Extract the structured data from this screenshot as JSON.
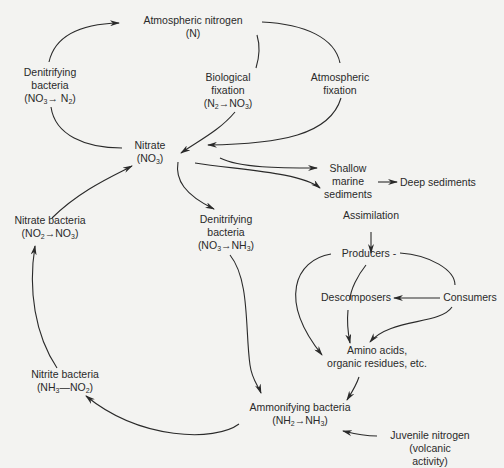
{
  "nodes": {
    "atmospheric_nitrogen": {
      "line1": "Atmospheric nitrogen",
      "line2": "(N)"
    },
    "denitrifying_top": {
      "line1": "Denitrifying",
      "line2": "bacteria",
      "line3": "(NO3 → N2)"
    },
    "biological_fixation": {
      "line1": "Biological",
      "line2": "fixation",
      "line3": "(N2 → NO3)"
    },
    "atmospheric_fixation": {
      "line1": "Atmospheric",
      "line2": "fixation"
    },
    "nitrate": {
      "line1": "Nitrate",
      "line2": "(NO3)"
    },
    "shallow_marine": {
      "line1": "Shallow",
      "line2": "marine",
      "line3": "sediments"
    },
    "deep_sediments": {
      "line1": "Deep sediments"
    },
    "assimilation": {
      "line1": "Assimilation"
    },
    "nitrate_bacteria": {
      "line1": "Nitrate bacteria",
      "line2": "(NO2 → NO3)"
    },
    "denitrifying_mid": {
      "line1": "Denitrifying",
      "line2": "bacteria",
      "line3": "(NO3 → NH3)"
    },
    "producers": {
      "line1": "Producers -"
    },
    "decomposers": {
      "line1": "Descomposers"
    },
    "consumers": {
      "line1": "Consumers"
    },
    "amino_acids": {
      "line1": "Amino acids,",
      "line2": "organic residues, etc."
    },
    "nitrite_bacteria": {
      "line1": "Nitrite bacteria",
      "line2": "(NH3 — NO2)"
    },
    "ammonifying": {
      "line1": "Ammonifying bacteria",
      "line2": "(NH2 → NH3)"
    },
    "juvenile_nitrogen": {
      "line1": "Juvenile nitrogen",
      "line2": "(volcanic",
      "line3": "activity)"
    }
  },
  "colors": {
    "background": "#f3f3f1",
    "ink": "#2a2a2a"
  }
}
